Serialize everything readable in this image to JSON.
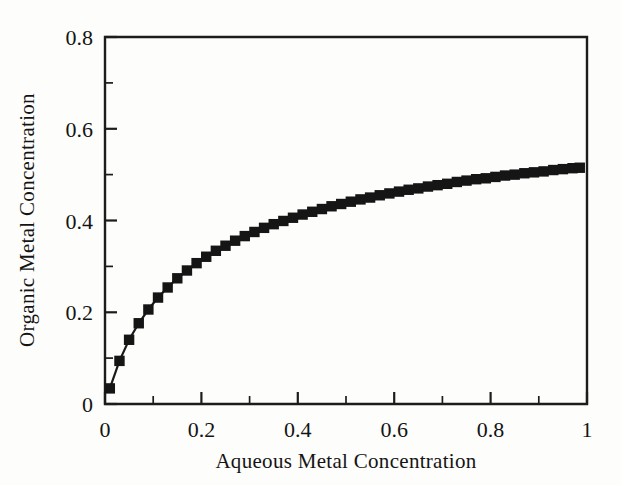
{
  "figure": {
    "background_color": "#fdfdfb",
    "ink_color": "#151515"
  },
  "chart_data": {
    "type": "line",
    "title": "",
    "subtitle": "",
    "xlabel": "Aqueous Metal Concentration",
    "ylabel": "Organic Metal Concentration",
    "xlim": [
      0,
      1
    ],
    "ylim": [
      0,
      0.8
    ],
    "grid": false,
    "legend": null,
    "legend_position": "none",
    "marker": "filled-square",
    "line_style": "solid",
    "series_color": "#151515",
    "xticks": [
      0,
      0.2,
      0.4,
      0.6,
      0.8,
      1
    ],
    "xtick_labels": [
      "0",
      "0.2",
      "0.4",
      "0.6",
      "0.8",
      "1"
    ],
    "x_minor_ticks": [
      0.1,
      0.3,
      0.5,
      0.7,
      0.9
    ],
    "yticks": [
      0,
      0.2,
      0.4,
      0.6,
      0.8
    ],
    "ytick_labels": [
      "0",
      "0.2",
      "0.4",
      "0.6",
      "0.8"
    ],
    "y_minor_ticks": [
      0.1,
      0.3,
      0.5,
      0.7
    ],
    "series": [
      {
        "name": "Equilibrium isotherm",
        "x": [
          0.01,
          0.03,
          0.05,
          0.07,
          0.09,
          0.11,
          0.13,
          0.15,
          0.17,
          0.19,
          0.21,
          0.23,
          0.25,
          0.27,
          0.29,
          0.31,
          0.33,
          0.35,
          0.37,
          0.39,
          0.41,
          0.43,
          0.45,
          0.47,
          0.49,
          0.51,
          0.53,
          0.55,
          0.57,
          0.59,
          0.61,
          0.63,
          0.65,
          0.67,
          0.69,
          0.71,
          0.73,
          0.75,
          0.77,
          0.79,
          0.81,
          0.83,
          0.85,
          0.87,
          0.89,
          0.91,
          0.93,
          0.95,
          0.97,
          0.985
        ],
        "y": [
          0.034,
          0.094,
          0.14,
          0.176,
          0.206,
          0.232,
          0.254,
          0.274,
          0.291,
          0.307,
          0.321,
          0.334,
          0.345,
          0.356,
          0.366,
          0.375,
          0.384,
          0.392,
          0.399,
          0.406,
          0.413,
          0.419,
          0.425,
          0.431,
          0.436,
          0.441,
          0.446,
          0.45,
          0.455,
          0.459,
          0.463,
          0.467,
          0.47,
          0.474,
          0.477,
          0.48,
          0.484,
          0.487,
          0.49,
          0.492,
          0.495,
          0.498,
          0.5,
          0.503,
          0.505,
          0.507,
          0.51,
          0.512,
          0.514,
          0.515
        ],
        "model": "Langmuir isotherm q = qmax*b*C/(1+b*C)",
        "qmax": 0.94,
        "b": 3.7
      }
    ]
  }
}
